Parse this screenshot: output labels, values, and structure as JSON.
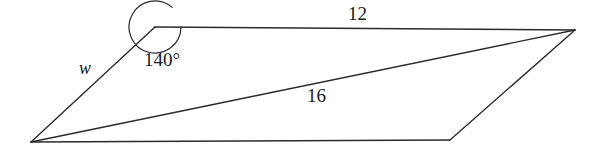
{
  "figure": {
    "type": "geometry-diagram",
    "shape": "parallelogram-with-diagonal",
    "background_color": "#ffffff",
    "stroke_color": "#2b2b2b",
    "text_color": "#1a1a1a",
    "vertices": {
      "top_left": [
        155,
        27
      ],
      "top_right": [
        575,
        30
      ],
      "bottom_right": [
        450,
        140
      ],
      "bottom_left": [
        31,
        142
      ]
    },
    "edges": [
      {
        "name": "top-edge",
        "from": "top_left",
        "to": "top_right",
        "label": "12"
      },
      {
        "name": "right-edge",
        "from": "top_right",
        "to": "bottom_right",
        "label": ""
      },
      {
        "name": "bottom-edge",
        "from": "bottom_right",
        "to": "bottom_left",
        "label": ""
      },
      {
        "name": "left-edge",
        "from": "bottom_left",
        "to": "top_left",
        "label": "w"
      }
    ],
    "diagonal": {
      "name": "diagonal",
      "from": "bottom_left",
      "to": "top_right",
      "label": "16"
    },
    "angle_marker": {
      "at_vertex": "top_left",
      "label": "140°",
      "measure_degrees": 140
    },
    "labels": {
      "top_length": "12",
      "angle": "140°",
      "left_side": "w",
      "diagonal_length": "16"
    }
  }
}
